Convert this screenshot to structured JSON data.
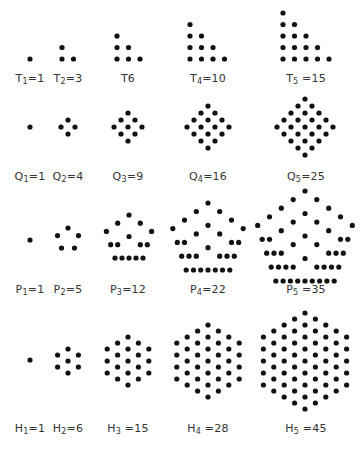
{
  "dot_color": "#111111",
  "rows": [
    {
      "family": "triangular",
      "letter": "T",
      "label_y": 72,
      "figures": [
        {
          "n": 1,
          "label": "T1=1",
          "letter": "T",
          "sub": "1",
          "eq": "=1",
          "cx": 30,
          "value": 1
        },
        {
          "n": 2,
          "label": "T2=3",
          "letter": "T",
          "sub": "2",
          "eq": "=3",
          "cx": 68,
          "value": 3
        },
        {
          "n": 3,
          "label": "T6",
          "letter": "T6",
          "sub": "",
          "eq": "",
          "cx": 128,
          "value": 6
        },
        {
          "n": 4,
          "label": "T4=10",
          "letter": "T",
          "sub": "4",
          "eq": "=10",
          "cx": 208,
          "value": 10
        },
        {
          "n": 5,
          "label": "T5=15",
          "letter": "T",
          "sub": "5",
          "eq": " =15",
          "cx": 308,
          "value": 15
        }
      ]
    },
    {
      "family": "square",
      "letter": "Q",
      "label_y": 170,
      "figures": [
        {
          "n": 1,
          "label": "Q1=1",
          "letter": "Q",
          "sub": "1",
          "eq": "=1",
          "cx": 30,
          "value": 1
        },
        {
          "n": 2,
          "label": "Q2=4",
          "letter": "Q",
          "sub": "2",
          "eq": "=4",
          "cx": 68,
          "value": 4
        },
        {
          "n": 3,
          "label": "Q3=9",
          "letter": "Q",
          "sub": "3",
          "eq": "=9",
          "cx": 128,
          "value": 9
        },
        {
          "n": 4,
          "label": "Q4=16",
          "letter": "Q",
          "sub": "4",
          "eq": "=16",
          "cx": 208,
          "value": 16
        },
        {
          "n": 5,
          "label": "Q5=25",
          "letter": "Q",
          "sub": "5",
          "eq": "=25",
          "cx": 305,
          "value": 25
        }
      ]
    },
    {
      "family": "pentagonal",
      "letter": "P",
      "label_y": 283,
      "figures": [
        {
          "n": 1,
          "label": "P1=1",
          "letter": "P",
          "sub": "1",
          "eq": "=1",
          "cx": 30,
          "value": 1
        },
        {
          "n": 2,
          "label": "P2=5",
          "letter": "P",
          "sub": "2",
          "eq": "=5",
          "cx": 68,
          "value": 5
        },
        {
          "n": 3,
          "label": "P3=12",
          "letter": "P",
          "sub": "3",
          "eq": "=12",
          "cx": 129,
          "value": 12
        },
        {
          "n": 4,
          "label": "P4=22",
          "letter": "P",
          "sub": "4",
          "eq": "=22",
          "cx": 208,
          "value": 22
        },
        {
          "n": 5,
          "label": "P5=35",
          "letter": "P",
          "sub": "5",
          "eq": " =35",
          "cx": 305,
          "value": 35
        }
      ]
    },
    {
      "family": "hexagonal",
      "letter": "H",
      "label_y": 422,
      "figures": [
        {
          "n": 1,
          "label": "H1=1",
          "letter": "H",
          "sub": "1",
          "eq": "=1",
          "cx": 30,
          "value": 1
        },
        {
          "n": 2,
          "label": "H2=6",
          "letter": "H",
          "sub": "2",
          "eq": "=6",
          "cx": 68,
          "value": 6
        },
        {
          "n": 3,
          "label": "H3=15",
          "letter": "H",
          "sub": "3",
          "eq": " =15",
          "cx": 128,
          "value": 15
        },
        {
          "n": 4,
          "label": "H4=28",
          "letter": "H",
          "sub": "4",
          "eq": " =28",
          "cx": 208,
          "value": 28
        },
        {
          "n": 5,
          "label": "H5=45",
          "letter": "H",
          "sub": "5",
          "eq": " =45",
          "cx": 305,
          "value": 45
        }
      ]
    }
  ],
  "geometry": {
    "triangular": {
      "base_y": 59,
      "spacing": 11.5,
      "left_x": [
        30,
        62,
        117,
        190,
        283
      ]
    },
    "square": {
      "center_y": 127,
      "spacing": 7
    },
    "pentagonal": {
      "apex_y": [
        240,
        228,
        215,
        203,
        191
      ],
      "base_y": [
        240,
        248,
        258,
        270,
        281
      ],
      "cx": [
        30,
        68,
        129,
        208,
        305
      ]
    },
    "hexagonal": {
      "center_y": [
        360,
        361,
        361,
        361,
        361
      ],
      "radius_step": 12
    }
  }
}
